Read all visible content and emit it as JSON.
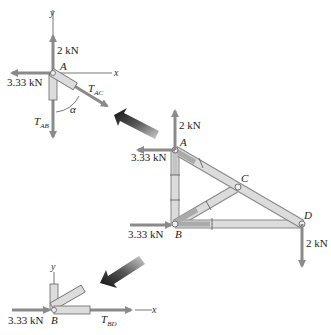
{
  "diagram": {
    "type": "truss-free-body-diagram",
    "colors": {
      "member_fill": "#dcdcdc",
      "member_stroke": "#888888",
      "force_arrow": "#8a8a8a",
      "axis_line": "#777777",
      "pointer_arrow_dark": "#111111",
      "pointer_arrow_light": "#bbbbbb"
    },
    "joint_a_fbd": {
      "axis_x": "x",
      "axis_y": "y",
      "joint_label": "A",
      "force_up": "2 kN",
      "force_left": "3.33 kN",
      "tension_ac_main": "T",
      "tension_ac_sub": "AC",
      "tension_ab_main": "T",
      "tension_ab_sub": "AB",
      "angle_label": "α"
    },
    "truss": {
      "joints": [
        "A",
        "B",
        "C",
        "D"
      ],
      "force_a_up": "2 kN",
      "force_a_left": "3.33 kN",
      "force_b_right": "3.33 kN",
      "force_d_down": "2 kN",
      "label_a": "A",
      "label_b": "B",
      "label_c": "C",
      "label_d": "D"
    },
    "joint_b_fbd": {
      "axis_x": "x",
      "axis_y": "y",
      "joint_label": "B",
      "force_right": "3.33 kN",
      "tension_bd_main": "T",
      "tension_bd_sub": "BD"
    }
  }
}
